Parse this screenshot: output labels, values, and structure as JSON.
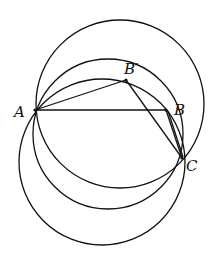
{
  "figure": {
    "type": "geometry-diagram",
    "points": [
      {
        "id": "A",
        "label": "A"
      },
      {
        "id": "Bp",
        "label": "B′"
      },
      {
        "id": "B",
        "label": "B"
      },
      {
        "id": "C",
        "label": "C"
      }
    ],
    "segments": [
      {
        "from": "A",
        "to": "B"
      },
      {
        "from": "A",
        "to": "Bp"
      },
      {
        "from": "Bp",
        "to": "C"
      },
      {
        "from": "B",
        "to": "C"
      }
    ],
    "circles": [
      {
        "id": "upper-circle",
        "through": [
          "A",
          "C"
        ]
      },
      {
        "id": "middle-circle",
        "through": [
          "A",
          "Bp",
          "B",
          "C"
        ]
      },
      {
        "id": "lower-circle",
        "through": [
          "A",
          "C"
        ]
      }
    ]
  }
}
